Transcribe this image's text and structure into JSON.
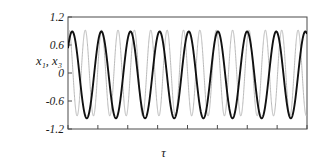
{
  "chart_data": {
    "type": "line",
    "title": "",
    "subtitle": "",
    "xlabel": "τ",
    "ylabel": "x₁, x₃",
    "ylabel_base": "x",
    "grid": false,
    "legend": null,
    "xlim": [
      0,
      100
    ],
    "ylim": [
      -1.2,
      1.2
    ],
    "yticks": [
      1.2,
      0.6,
      0,
      -0.6,
      -1.2
    ],
    "ytick_labels": [
      "1.2",
      "0.6",
      "0",
      "-0.6",
      "-1.2"
    ],
    "xticks": [
      0,
      12.5,
      25,
      37.5,
      50,
      62.5,
      75,
      87.5,
      100
    ],
    "xtick_labels": [
      "",
      "",
      "",
      "",
      "",
      "",
      "",
      "",
      ""
    ],
    "series": [
      {
        "name": "x3",
        "color": "#b9b9b9",
        "line_width": 1.0,
        "waveform": "sine",
        "amplitude": 0.92,
        "cycles": 14.6,
        "phase_deg": 70,
        "offset": 0.0
      },
      {
        "name": "x1",
        "color": "#111111",
        "line_width": 1.9,
        "waveform": "sine",
        "amplitude": 0.93,
        "cycles": 8.2,
        "phase_deg": 38,
        "offset": -0.04
      }
    ]
  },
  "axes": {
    "frame_color": "#4a4a4a",
    "background": "#ffffff",
    "tick_color": "#4a4a4a"
  }
}
